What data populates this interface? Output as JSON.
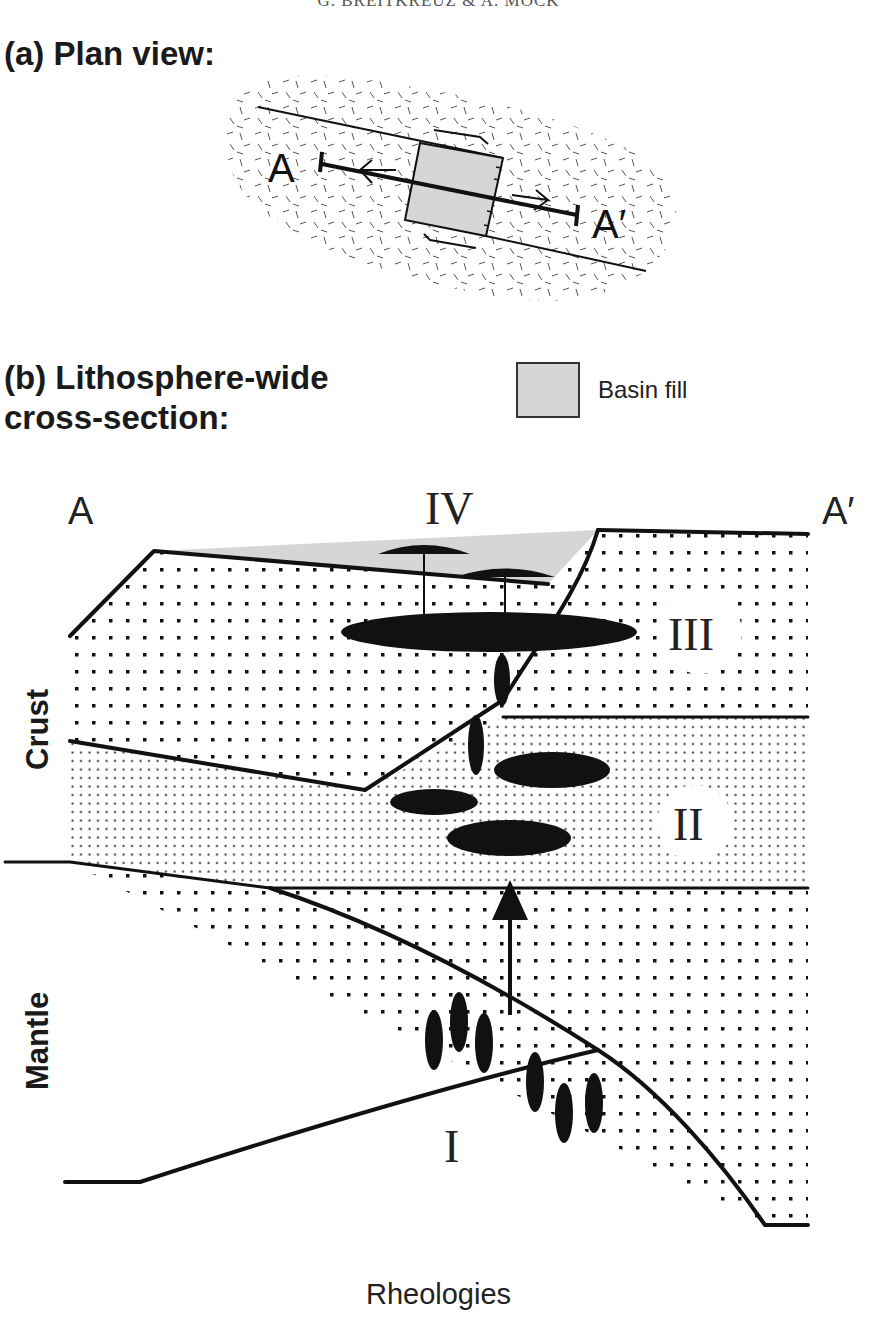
{
  "running_head": "G. BREITKREUZ & A. MOCK",
  "panel_a": {
    "title": "(a) Plan view:",
    "labels": {
      "start": "A",
      "end": "A′"
    }
  },
  "panel_b": {
    "title_line1": "(b) Lithosphere-wide",
    "title_line2": "cross-section:",
    "legend": {
      "basin_fill": "Basin fill",
      "basin_fill_color": "#d6d6d6"
    },
    "section_labels": {
      "start": "A",
      "end": "A′"
    },
    "zones": {
      "I": "I",
      "II": "II",
      "III": "III",
      "IV": "IV"
    },
    "layer_labels": {
      "crust": "Crust",
      "mantle": "Mantle"
    },
    "x_axis_label": "Rheologies"
  },
  "colors": {
    "line": "#111111",
    "magma": "#111111",
    "basin": "#d6d6d6",
    "background": "#ffffff"
  }
}
